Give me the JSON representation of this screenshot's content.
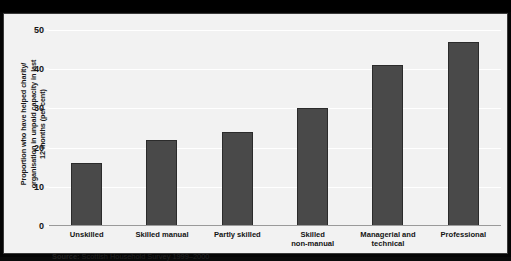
{
  "chart_data": {
    "type": "bar",
    "title": "",
    "xlabel": "",
    "ylabel": "Proportion who have helped charity/ organisation in unpaid capacity in last 12 months (per cent)",
    "ylabel_line1": "Proportion who have helped charity/",
    "ylabel_line2": "organisation in unpaid capacity in last",
    "ylabel_line3": "12 months (per cent)",
    "categories": [
      "Unskilled",
      "Skilled manual",
      "Partly skilled",
      "Skilled non-manual",
      "Managerial and technical",
      "Professional"
    ],
    "category_lines": [
      [
        "Unskilled"
      ],
      [
        "Skilled manual"
      ],
      [
        "Partly skilled"
      ],
      [
        "Skilled",
        "non-manual"
      ],
      [
        "Managerial and",
        "technical"
      ],
      [
        "Professional"
      ]
    ],
    "values": [
      16,
      22,
      24,
      30,
      41,
      47
    ],
    "ylim": [
      0,
      50
    ],
    "yticks": [
      0,
      10,
      20,
      30,
      40,
      50
    ],
    "ytick_labels": [
      "0",
      "10",
      "20",
      "30",
      "40",
      "50"
    ],
    "grid": true,
    "legend": false,
    "bar_color": "#494949",
    "bar_border_color": "#2b2b2b",
    "plot_background": "#f2f2f2",
    "gridline_color": "#ffffff"
  },
  "source": {
    "prefix": "Source:",
    "text": "Scottish Household Survey 1999–2000"
  }
}
